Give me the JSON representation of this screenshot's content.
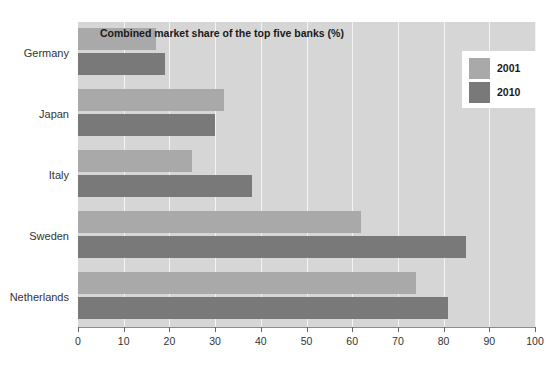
{
  "page": {
    "caption_fragment": "concentration."
  },
  "chart_data": {
    "type": "bar",
    "orientation": "horizontal",
    "title": "Combined market share of the top five banks (%)",
    "xlabel": "",
    "ylabel": "",
    "xlim": [
      0,
      100
    ],
    "xticks": [
      0,
      10,
      20,
      30,
      40,
      50,
      60,
      70,
      80,
      90,
      100
    ],
    "xtick_labels": [
      "0",
      "10",
      "20",
      "30",
      "40",
      "50",
      "60",
      "70",
      "80",
      "90",
      "100"
    ],
    "categories": [
      "Germany",
      "Japan",
      "Italy",
      "Sweden",
      "Netherlands"
    ],
    "grid": true,
    "grid_axis": "x",
    "legend_position": "top-right",
    "series": [
      {
        "name": "2001",
        "color": "#a9a9a9",
        "values": [
          17,
          32,
          25,
          62,
          74
        ]
      },
      {
        "name": "2010",
        "color": "#797979",
        "values": [
          19,
          30,
          38,
          85,
          81
        ]
      }
    ],
    "plot_background": "#d6d6d6",
    "gridline_color": "#f4f4f4"
  }
}
